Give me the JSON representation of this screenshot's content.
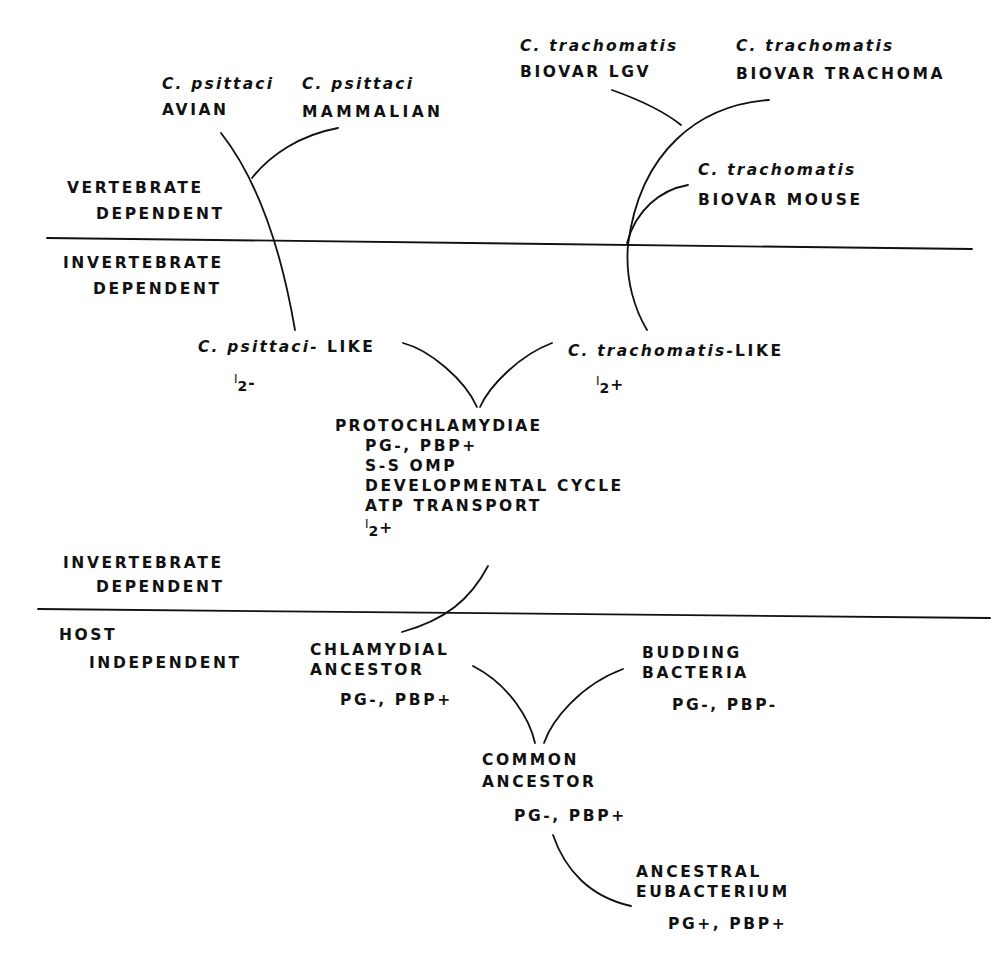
{
  "zones": {
    "vertebrate_dependent": [
      "VERTEBRATE",
      "DEPENDENT"
    ],
    "invertebrate_dependent_upper": [
      "INVERTEBRATE",
      "DEPENDENT"
    ],
    "invertebrate_dependent_lower": [
      "INVERTEBRATE",
      "DEPENDENT"
    ],
    "host_independent": [
      "HOST",
      "INDEPENDENT"
    ]
  },
  "taxa": {
    "psittaci_avian": {
      "species": "C. psittaci",
      "strain": "AVIAN"
    },
    "psittaci_mammalian": {
      "species": "C. psittaci",
      "strain": "MAMMALIAN"
    },
    "trachomatis_lgv": {
      "species": "C. trachomatis",
      "strain": "BIOVAR LGV"
    },
    "trachomatis_trachoma": {
      "species": "C. trachomatis",
      "strain": "BIOVAR TRACHOMA"
    },
    "trachomatis_mouse": {
      "species": "C. trachomatis",
      "strain": "BIOVAR MOUSE"
    },
    "psittaci_like": {
      "species": "C. psittaci-",
      "suffix": "LIKE",
      "iodine_prefix": "I",
      "iodine_sub": "2",
      "iodine_sign": "-"
    },
    "trachomatis_like": {
      "species": "C. trachomatis-",
      "suffix": "LIKE",
      "iodine_prefix": "I",
      "iodine_sub": "2",
      "iodine_sign": "+"
    },
    "protochlamydiae": {
      "name": "PROTOCHLAMYDIAE",
      "traits": [
        "PG-, PBP+",
        "S-S OMP",
        "DEVELOPMENTAL CYCLE",
        "ATP TRANSPORT"
      ],
      "iodine_prefix": "I",
      "iodine_sub": "2",
      "iodine_sign": "+"
    },
    "chlamydial_ancestor": {
      "name": [
        "CHLAMYDIAL",
        "ANCESTOR"
      ],
      "traits": "PG-, PBP+"
    },
    "budding_bacteria": {
      "name": [
        "BUDDING",
        "BACTERIA"
      ],
      "traits": "PG-, PBP-"
    },
    "common_ancestor": {
      "name": [
        "COMMON",
        "ANCESTOR"
      ],
      "traits": "PG-, PBP+"
    },
    "ancestral_eubacterium": {
      "name": [
        "ANCESTRAL",
        "EUBACTERIUM"
      ],
      "traits": "PG+, PBP+"
    }
  }
}
